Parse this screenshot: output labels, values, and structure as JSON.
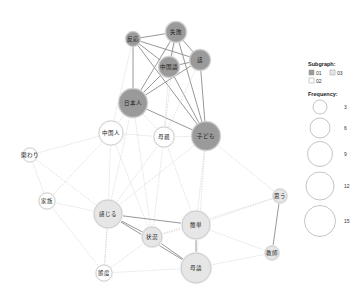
{
  "colors": {
    "subgraph_01": "#9a9a9a",
    "subgraph_02": "#ffffff",
    "subgraph_03": "#e6e6e6",
    "node_stroke": "#b8b8b8",
    "edge_strong": "#8c8c8c",
    "edge_weak": "#cfcfcf"
  },
  "nodes": [
    {
      "id": "hannou",
      "label": "反応",
      "x": 133,
      "y": 39,
      "r": 7,
      "subgraph": "01"
    },
    {
      "id": "shippai",
      "label": "失敗",
      "x": 176,
      "y": 32,
      "r": 10,
      "subgraph": "01"
    },
    {
      "id": "chuugokugo",
      "label": "中国語",
      "x": 169,
      "y": 67,
      "r": 10,
      "subgraph": "01"
    },
    {
      "id": "hanashi",
      "label": "話",
      "x": 200,
      "y": 60,
      "r": 10,
      "subgraph": "01"
    },
    {
      "id": "nihonjin",
      "label": "日本人",
      "x": 133,
      "y": 103,
      "r": 14,
      "subgraph": "01"
    },
    {
      "id": "kodomo",
      "label": "子ども",
      "x": 206,
      "y": 136,
      "r": 14,
      "subgraph": "01"
    },
    {
      "id": "chuugokujin",
      "label": "中国人",
      "x": 111,
      "y": 133,
      "r": 12,
      "subgraph": "02"
    },
    {
      "id": "hahaoya",
      "label": "母親",
      "x": 164,
      "y": 137,
      "r": 10,
      "subgraph": "02"
    },
    {
      "id": "kakawari",
      "label": "関わり",
      "x": 30,
      "y": 155,
      "r": 7,
      "subgraph": "02"
    },
    {
      "id": "kazoku",
      "label": "家族",
      "x": 47,
      "y": 201,
      "r": 8,
      "subgraph": "02"
    },
    {
      "id": "kanjiru",
      "label": "感じる",
      "x": 108,
      "y": 214,
      "r": 14,
      "subgraph": "03"
    },
    {
      "id": "joukyou",
      "label": "状況",
      "x": 152,
      "y": 237,
      "r": 10,
      "subgraph": "03"
    },
    {
      "id": "kantan",
      "label": "簡単",
      "x": 196,
      "y": 225,
      "r": 14,
      "subgraph": "03"
    },
    {
      "id": "omou",
      "label": "思う",
      "x": 280,
      "y": 196,
      "r": 7,
      "subgraph": "03"
    },
    {
      "id": "kyoushi",
      "label": "教師",
      "x": 272,
      "y": 253,
      "r": 7,
      "subgraph": "03"
    },
    {
      "id": "taido",
      "label": "態度",
      "x": 104,
      "y": 273,
      "r": 8,
      "subgraph": "02"
    },
    {
      "id": "bogo",
      "label": "母語",
      "x": 196,
      "y": 268,
      "r": 15,
      "subgraph": "03"
    }
  ],
  "edges": [
    {
      "s": "hannou",
      "t": "shippai",
      "w": "strong"
    },
    {
      "s": "hannou",
      "t": "chuugokugo",
      "w": "strong"
    },
    {
      "s": "hannou",
      "t": "hanashi",
      "w": "strong"
    },
    {
      "s": "hannou",
      "t": "nihonjin",
      "w": "strong"
    },
    {
      "s": "hannou",
      "t": "kodomo",
      "w": "strong"
    },
    {
      "s": "shippai",
      "t": "chuugokugo",
      "w": "strong"
    },
    {
      "s": "shippai",
      "t": "hanashi",
      "w": "strong"
    },
    {
      "s": "shippai",
      "t": "nihonjin",
      "w": "strong"
    },
    {
      "s": "shippai",
      "t": "kodomo",
      "w": "strong"
    },
    {
      "s": "chuugokugo",
      "t": "hanashi",
      "w": "strong"
    },
    {
      "s": "chuugokugo",
      "t": "nihonjin",
      "w": "strong"
    },
    {
      "s": "chuugokugo",
      "t": "kodomo",
      "w": "strong"
    },
    {
      "s": "hanashi",
      "t": "nihonjin",
      "w": "strong"
    },
    {
      "s": "hanashi",
      "t": "kodomo",
      "w": "strong"
    },
    {
      "s": "nihonjin",
      "t": "kodomo",
      "w": "strong"
    },
    {
      "s": "hannou",
      "t": "chuugokujin",
      "w": "weak"
    },
    {
      "s": "shippai",
      "t": "hahaoya",
      "w": "weak"
    },
    {
      "s": "chuugokugo",
      "t": "hahaoya",
      "w": "weak"
    },
    {
      "s": "hanashi",
      "t": "hahaoya",
      "w": "weak"
    },
    {
      "s": "nihonjin",
      "t": "chuugokujin",
      "w": "weak"
    },
    {
      "s": "nihonjin",
      "t": "hahaoya",
      "w": "weak"
    },
    {
      "s": "nihonjin",
      "t": "kanjiru",
      "w": "weak"
    },
    {
      "s": "nihonjin",
      "t": "joukyou",
      "w": "weak"
    },
    {
      "s": "chuugokujin",
      "t": "hahaoya",
      "w": "weak"
    },
    {
      "s": "chuugokujin",
      "t": "kakawari",
      "w": "weak"
    },
    {
      "s": "chuugokujin",
      "t": "kazoku",
      "w": "weak"
    },
    {
      "s": "chuugokujin",
      "t": "kanjiru",
      "w": "weak"
    },
    {
      "s": "chuugokujin",
      "t": "joukyou",
      "w": "weak"
    },
    {
      "s": "hahaoya",
      "t": "kodomo",
      "w": "weak"
    },
    {
      "s": "hahaoya",
      "t": "kanjiru",
      "w": "weak"
    },
    {
      "s": "hahaoya",
      "t": "joukyou",
      "w": "weak"
    },
    {
      "s": "hahaoya",
      "t": "kantan",
      "w": "weak"
    },
    {
      "s": "kodomo",
      "t": "kanjiru",
      "w": "weak"
    },
    {
      "s": "kodomo",
      "t": "kantan",
      "w": "weak"
    },
    {
      "s": "kodomo",
      "t": "bogo",
      "w": "weak"
    },
    {
      "s": "kodomo",
      "t": "omou",
      "w": "weak"
    },
    {
      "s": "kakawari",
      "t": "kazoku",
      "w": "weak"
    },
    {
      "s": "kakawari",
      "t": "kanjiru",
      "w": "weak"
    },
    {
      "s": "kazoku",
      "t": "kanjiru",
      "w": "weak"
    },
    {
      "s": "kazoku",
      "t": "taido",
      "w": "weak"
    },
    {
      "s": "kanjiru",
      "t": "joukyou",
      "w": "strong"
    },
    {
      "s": "kanjiru",
      "t": "kantan",
      "w": "strong"
    },
    {
      "s": "kanjiru",
      "t": "bogo",
      "w": "strong"
    },
    {
      "s": "kanjiru",
      "t": "taido",
      "w": "weak"
    },
    {
      "s": "joukyou",
      "t": "kantan",
      "w": "weak"
    },
    {
      "s": "joukyou",
      "t": "bogo",
      "w": "strong"
    },
    {
      "s": "joukyou",
      "t": "taido",
      "w": "weak"
    },
    {
      "s": "kantan",
      "t": "bogo",
      "w": "strong"
    },
    {
      "s": "kantan",
      "t": "omou",
      "w": "weak"
    },
    {
      "s": "kantan",
      "t": "kyoushi",
      "w": "weak"
    },
    {
      "s": "omou",
      "t": "kyoushi",
      "w": "strong"
    },
    {
      "s": "omou",
      "t": "joukyou",
      "w": "weak"
    },
    {
      "s": "bogo",
      "t": "kyoushi",
      "w": "weak"
    },
    {
      "s": "bogo",
      "t": "taido",
      "w": "weak"
    },
    {
      "s": "taido",
      "t": "kanjiru",
      "w": "weak"
    }
  ],
  "legend": {
    "subgraph_title": "Subgraph:",
    "subgraph_items": [
      {
        "label": "01",
        "color": "#9a9a9a"
      },
      {
        "label": "03",
        "color": "#e6e6e6"
      },
      {
        "label": "02",
        "color": "#ffffff"
      }
    ],
    "frequency_title": "Frequency:",
    "frequency_items": [
      {
        "label": "3",
        "r": 7
      },
      {
        "label": "6",
        "r": 10
      },
      {
        "label": "9",
        "r": 12.5
      },
      {
        "label": "12",
        "r": 14
      },
      {
        "label": "15",
        "r": 15.5
      }
    ]
  }
}
